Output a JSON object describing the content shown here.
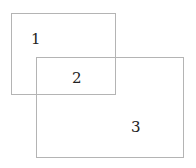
{
  "diagram": {
    "regions": [
      {
        "id": "rect-1",
        "label": "1"
      },
      {
        "id": "overlap",
        "label": "2"
      },
      {
        "id": "rect-3",
        "label": "3"
      }
    ]
  }
}
